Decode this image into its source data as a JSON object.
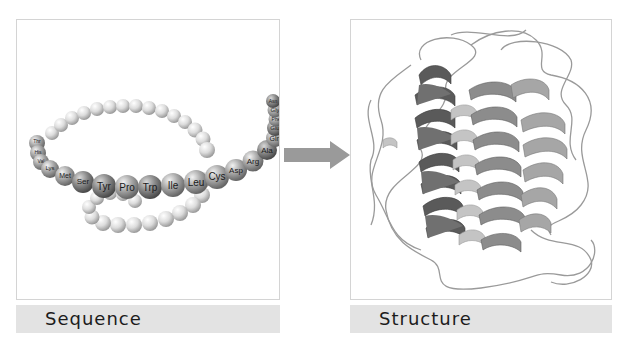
{
  "panels": {
    "sequence": {
      "caption": "Sequence",
      "labeled_residues": [
        "Thr",
        "His",
        "Val",
        "Lys",
        "Met",
        "Ser",
        "Tyr",
        "Pro",
        "Trp",
        "Ile",
        "Leu",
        "Cys",
        "Asp",
        "Arg",
        "Ala",
        "Gln",
        "Glu",
        "Phe",
        "Gly",
        "Asn"
      ]
    },
    "structure": {
      "caption": "Structure"
    }
  },
  "arrow": {
    "direction": "right",
    "color": "#9a9a9a"
  },
  "colors": {
    "bead_light": "#e2e2e2",
    "bead_dark": "#6f6f6f",
    "helix_dark": "#555555",
    "helix_mid": "#8a8a8a",
    "helix_light": "#b8b8b8",
    "coil": "#8f8f8f",
    "caption_bg": "#e3e3e3",
    "panel_border": "#d4d4d4"
  }
}
